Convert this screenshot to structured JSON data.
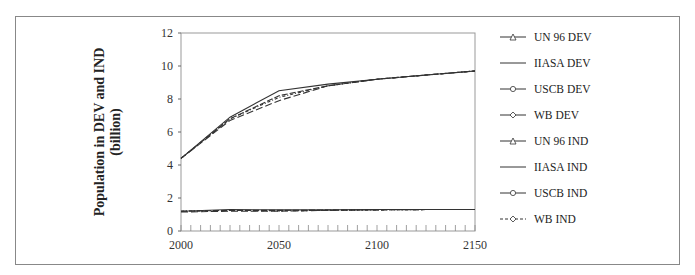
{
  "chart_data": {
    "type": "line",
    "title": "",
    "xlabel": "",
    "ylabel": "Population in DEV and IND (billion)",
    "ylabel_lines": [
      "Population in DEV and IND",
      "(billion)"
    ],
    "xlim": [
      2000,
      2150
    ],
    "ylim": [
      0,
      12
    ],
    "x_ticks": [
      2000,
      2050,
      2100,
      2150
    ],
    "y_ticks": [
      0,
      2,
      4,
      6,
      8,
      10,
      12
    ],
    "grid": false,
    "legend_position": "right",
    "x": [
      2000,
      2025,
      2050,
      2075,
      2100,
      2125,
      2150
    ],
    "series": [
      {
        "name": "UN 96 DEV",
        "marker": "triangle",
        "dash": "solid",
        "values": [
          4.4,
          6.8,
          8.2,
          8.8,
          9.2,
          9.45,
          9.7
        ]
      },
      {
        "name": "IIASA DEV",
        "marker": "none",
        "dash": "solid",
        "values": [
          4.4,
          6.9,
          8.5,
          8.9,
          9.2,
          9.45,
          9.7
        ]
      },
      {
        "name": "USCB DEV",
        "marker": "circle",
        "dash": "solid",
        "values": [
          4.4,
          6.8,
          8.1,
          8.8,
          9.2,
          9.45,
          9.7
        ]
      },
      {
        "name": "WB DEV",
        "marker": "diamond",
        "dash": "dash",
        "values": [
          4.4,
          6.7,
          7.9,
          8.8,
          9.2,
          9.45,
          9.7
        ]
      },
      {
        "name": "UN 96 IND",
        "marker": "triangle",
        "dash": "solid",
        "values": [
          1.2,
          1.25,
          1.25,
          1.27,
          1.28,
          1.3,
          1.3
        ]
      },
      {
        "name": "IIASA IND",
        "marker": "none",
        "dash": "solid",
        "values": [
          1.2,
          1.3,
          1.28,
          1.28,
          1.3,
          1.3,
          1.3
        ]
      },
      {
        "name": "USCB IND",
        "marker": "circle",
        "dash": "solid",
        "values": [
          1.2,
          1.25,
          1.22,
          1.25,
          1.28,
          1.3,
          1.3
        ]
      },
      {
        "name": "WB IND",
        "marker": "diamond",
        "dash": "dash",
        "values": [
          1.15,
          1.2,
          1.2,
          1.25,
          1.28,
          1.3,
          1.3
        ]
      }
    ]
  },
  "axis": {
    "y_tick_labels": [
      "0",
      "2",
      "4",
      "6",
      "8",
      "10",
      "12"
    ],
    "x_tick_labels": [
      "2000",
      "2050",
      "2100",
      "2150"
    ],
    "ylabel_line1": "Population in DEV and IND",
    "ylabel_line2": "(billion)"
  },
  "legend": {
    "items": [
      {
        "label": "UN 96 DEV"
      },
      {
        "label": "IIASA DEV"
      },
      {
        "label": "USCB DEV"
      },
      {
        "label": "WB DEV"
      },
      {
        "label": "UN 96 IND"
      },
      {
        "label": "IIASA IND"
      },
      {
        "label": "USCB IND"
      },
      {
        "label": "WB IND"
      }
    ]
  }
}
